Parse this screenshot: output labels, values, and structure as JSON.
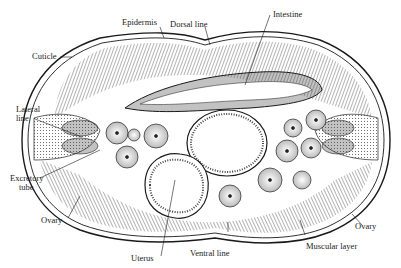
{
  "figure": {
    "labels": {
      "epidermis": "Epidermis",
      "dorsal_line": "Dorsal line",
      "intestine": "Intestine",
      "cuticle": "Cuticle",
      "lateral_line_1": "Lateral",
      "lateral_line_2": "line",
      "excretory_tube_1": "Excretory",
      "excretory_tube_2": "tube",
      "ovary_left": "Ovary",
      "uterus": "Uterus",
      "ventral_line": "Ventral line",
      "muscular_layer": "Muscular layer",
      "ovary_right": "Ovary"
    },
    "colors": {
      "ink": "#1a1a1a",
      "paper": "#ffffff",
      "hatch": "#555555"
    }
  }
}
